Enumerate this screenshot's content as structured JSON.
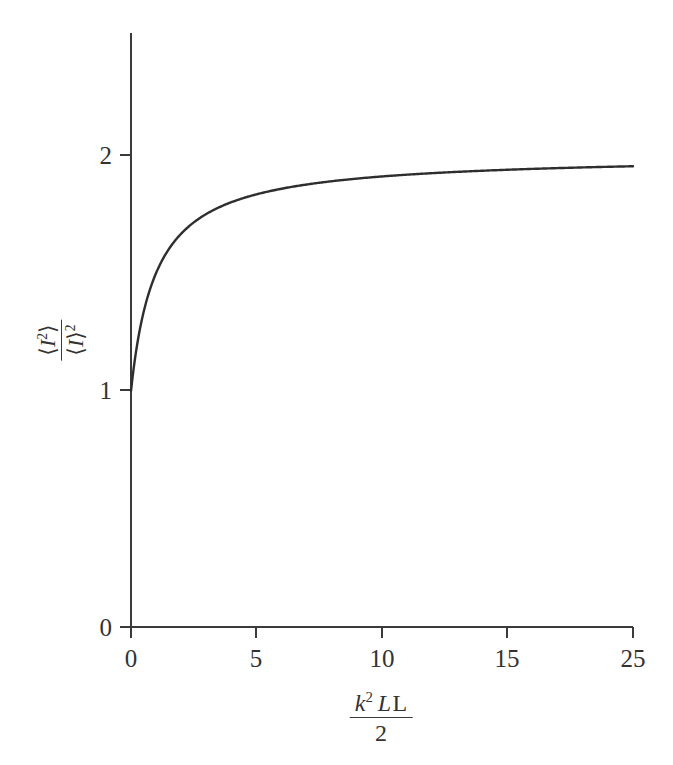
{
  "figure": {
    "background_color": "#ffffff",
    "line_color": "#3a3a3a",
    "text_color": "#333333"
  },
  "axis_labels": {
    "y": {
      "numerator_open": "⟨",
      "numerator_symbol": "I",
      "numerator_exponent": "2",
      "numerator_close": "⟩",
      "denominator_open": "⟨",
      "denominator_symbol": "I",
      "denominator_close": "⟩",
      "denominator_exponent": "2",
      "plain": "⟨I²⟩ / ⟨I⟩²"
    },
    "x": {
      "numerator_k": "k",
      "numerator_k_exponent": "2",
      "numerator_L_italic": "L",
      "numerator_L_upright": "L",
      "denominator": "2",
      "plain": "k²LL / 2"
    }
  },
  "chart_data": {
    "type": "line",
    "title": "",
    "xlabel": "k²LL / 2",
    "ylabel": "⟨I²⟩ / ⟨I⟩²",
    "xlim": [
      0,
      20
    ],
    "ylim": [
      0,
      2.52
    ],
    "grid": false,
    "legend": null,
    "xticks": [
      0,
      5,
      10,
      15,
      20
    ],
    "xtick_labels": [
      "0",
      "5",
      "10",
      "15",
      "25"
    ],
    "yticks": [
      0,
      1,
      2
    ],
    "ytick_labels": [
      "0",
      "1",
      "2"
    ],
    "series": [
      {
        "name": "intensity-variance-ratio",
        "formula": "2 - 1/(1 + x)",
        "x": [
          0,
          0.25,
          0.5,
          0.75,
          1,
          1.5,
          2,
          2.5,
          3,
          3.5,
          4,
          4.5,
          5,
          6,
          7,
          8,
          9,
          10,
          11,
          12,
          13,
          14,
          15,
          16,
          17,
          18,
          19,
          20
        ],
        "y": [
          1.0,
          1.2,
          1.333,
          1.429,
          1.5,
          1.6,
          1.667,
          1.714,
          1.75,
          1.778,
          1.8,
          1.818,
          1.833,
          1.857,
          1.875,
          1.889,
          1.9,
          1.909,
          1.917,
          1.923,
          1.929,
          1.933,
          1.938,
          1.941,
          1.944,
          1.947,
          1.95,
          1.952
        ]
      }
    ]
  }
}
